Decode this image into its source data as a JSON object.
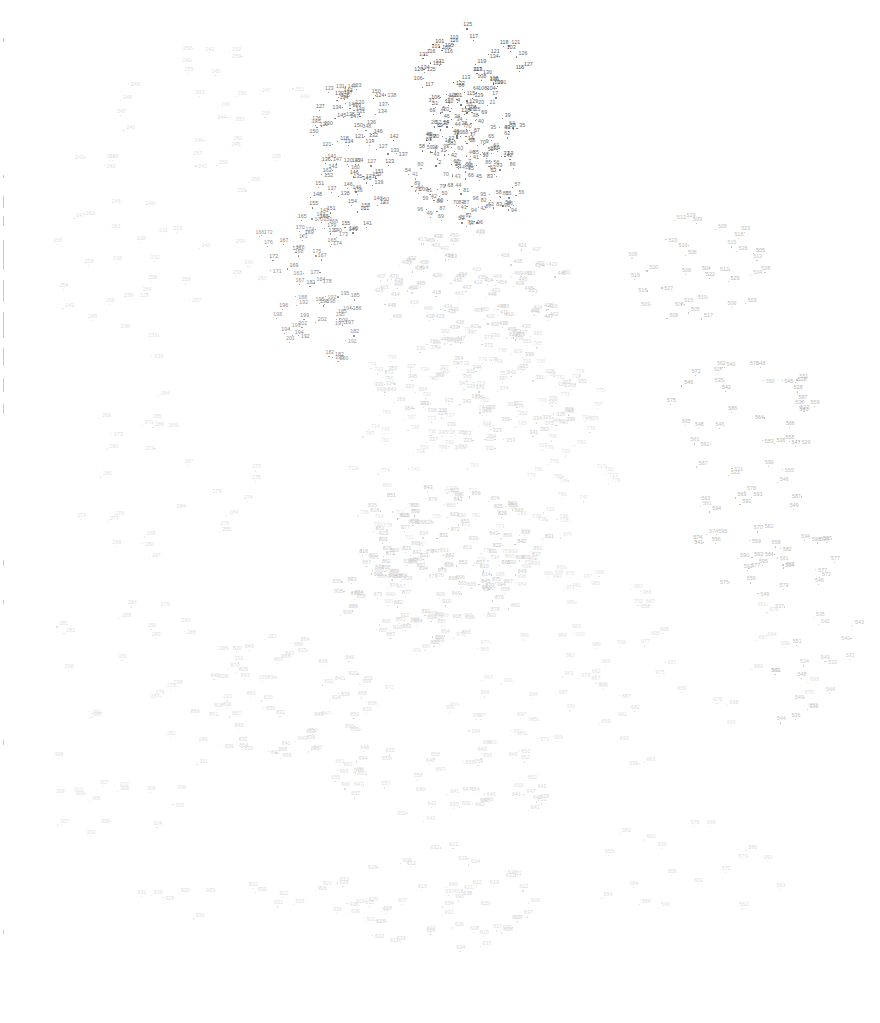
{
  "page": {
    "kind": "connect-the-dots-puzzle",
    "width": 880,
    "height": 1023,
    "background_color": "#ffffff",
    "title": ""
  },
  "render": {
    "dot_count": 1000,
    "number_start": 1,
    "number_end": 1000,
    "font_size_px": 5.2,
    "dot_radius_px": 0.65,
    "ink_dark_color": "#3a3a3a",
    "ink_mid_color": "#9a9a9a",
    "ink_light_color": "#d8d8d8",
    "ink_faintest_color": "#ececec",
    "seed": 20240517
  },
  "clusters": [
    {
      "name": "head-top-dense",
      "cx": 470,
      "cy": 70,
      "rx": 55,
      "ry": 42,
      "count": 48,
      "ink": 0.12,
      "num_lo": 100,
      "num_hi": 135
    },
    {
      "name": "core-upper-dense",
      "cx": 468,
      "cy": 135,
      "rx": 52,
      "ry": 46,
      "count": 80,
      "ink": 0.16,
      "num_lo": 1,
      "num_hi": 70
    },
    {
      "name": "core-center-dense",
      "cx": 462,
      "cy": 185,
      "rx": 58,
      "ry": 44,
      "count": 70,
      "ink": 0.22,
      "num_lo": 40,
      "num_hi": 100
    },
    {
      "name": "left-ridge-dark",
      "cx": 355,
      "cy": 130,
      "rx": 46,
      "ry": 50,
      "count": 52,
      "ink": 0.18,
      "num_lo": 118,
      "num_hi": 152
    },
    {
      "name": "left-ridge-lower",
      "cx": 345,
      "cy": 195,
      "rx": 40,
      "ry": 38,
      "count": 34,
      "ink": 0.2,
      "num_lo": 136,
      "num_hi": 162
    },
    {
      "name": "left-mid-band",
      "cx": 300,
      "cy": 250,
      "rx": 44,
      "ry": 36,
      "count": 30,
      "ink": 0.28,
      "num_lo": 163,
      "num_hi": 180
    },
    {
      "name": "left-mid-lower",
      "cx": 320,
      "cy": 325,
      "rx": 46,
      "ry": 40,
      "count": 32,
      "ink": 0.3,
      "num_lo": 180,
      "num_hi": 202
    },
    {
      "name": "mid-body-broad",
      "cx": 470,
      "cy": 290,
      "rx": 95,
      "ry": 60,
      "count": 95,
      "ink": 0.62,
      "num_lo": 400,
      "num_hi": 470
    },
    {
      "name": "mid-body-center",
      "cx": 480,
      "cy": 390,
      "rx": 100,
      "ry": 62,
      "count": 90,
      "ink": 0.66,
      "num_lo": 320,
      "num_hi": 400
    },
    {
      "name": "right-upper-chain",
      "cx": 700,
      "cy": 270,
      "rx": 70,
      "ry": 55,
      "count": 34,
      "ink": 0.52,
      "num_lo": 502,
      "num_hi": 530
    },
    {
      "name": "right-mid-chain",
      "cx": 740,
      "cy": 420,
      "rx": 78,
      "ry": 60,
      "count": 38,
      "ink": 0.5,
      "num_lo": 520,
      "num_hi": 590
    },
    {
      "name": "right-lower-chain",
      "cx": 760,
      "cy": 540,
      "rx": 80,
      "ry": 62,
      "count": 40,
      "ink": 0.52,
      "num_lo": 540,
      "num_hi": 600
    },
    {
      "name": "right-edge-sparse",
      "cx": 815,
      "cy": 660,
      "rx": 45,
      "ry": 110,
      "count": 20,
      "ink": 0.58,
      "num_lo": 530,
      "num_hi": 552
    },
    {
      "name": "center-lower-dense",
      "cx": 450,
      "cy": 540,
      "rx": 95,
      "ry": 55,
      "count": 85,
      "ink": 0.6,
      "num_lo": 800,
      "num_hi": 880
    },
    {
      "name": "center-lower-b",
      "cx": 420,
      "cy": 600,
      "rx": 90,
      "ry": 50,
      "count": 60,
      "ink": 0.64,
      "num_lo": 850,
      "num_hi": 912
    },
    {
      "name": "lower-left-band",
      "cx": 280,
      "cy": 700,
      "rx": 90,
      "ry": 60,
      "count": 55,
      "ink": 0.7,
      "num_lo": 820,
      "num_hi": 870
    },
    {
      "name": "lower-center-band",
      "cx": 450,
      "cy": 780,
      "rx": 120,
      "ry": 45,
      "count": 50,
      "ink": 0.72,
      "num_lo": 640,
      "num_hi": 660
    },
    {
      "name": "bottom-cluster",
      "cx": 430,
      "cy": 900,
      "rx": 100,
      "ry": 55,
      "count": 45,
      "ink": 0.7,
      "num_lo": 606,
      "num_hi": 640
    },
    {
      "name": "bottom-row-far",
      "cx": 300,
      "cy": 905,
      "rx": 180,
      "ry": 22,
      "count": 22,
      "ink": 0.74,
      "num_lo": 920,
      "num_hi": 940
    },
    {
      "name": "top-left-sparse",
      "cx": 190,
      "cy": 110,
      "rx": 130,
      "ry": 90,
      "count": 34,
      "ink": 0.8,
      "num_lo": 240,
      "num_hi": 262
    },
    {
      "name": "left-sparse-mid",
      "cx": 160,
      "cy": 270,
      "rx": 110,
      "ry": 90,
      "count": 30,
      "ink": 0.78,
      "num_lo": 226,
      "num_hi": 264
    },
    {
      "name": "left-sparse-low",
      "cx": 150,
      "cy": 470,
      "rx": 110,
      "ry": 90,
      "count": 26,
      "ink": 0.78,
      "num_lo": 264,
      "num_hi": 290
    },
    {
      "name": "left-sparse-lower",
      "cx": 160,
      "cy": 660,
      "rx": 110,
      "ry": 90,
      "count": 24,
      "ink": 0.8,
      "num_lo": 275,
      "num_hi": 300
    },
    {
      "name": "left-bottom-sparse",
      "cx": 120,
      "cy": 790,
      "rx": 95,
      "ry": 60,
      "count": 16,
      "ink": 0.82,
      "num_lo": 300,
      "num_hi": 312
    },
    {
      "name": "right-far-sparse",
      "cx": 700,
      "cy": 680,
      "rx": 110,
      "ry": 100,
      "count": 26,
      "ink": 0.74,
      "num_lo": 655,
      "num_hi": 700
    },
    {
      "name": "right-bottom-sparse",
      "cx": 690,
      "cy": 880,
      "rx": 110,
      "ry": 70,
      "count": 18,
      "ink": 0.76,
      "num_lo": 552,
      "num_hi": 604
    },
    {
      "name": "center-fill-haze",
      "cx": 480,
      "cy": 450,
      "rx": 150,
      "ry": 120,
      "count": 110,
      "ink": 0.8,
      "num_lo": 700,
      "num_hi": 800
    },
    {
      "name": "center-fill-haze-b",
      "cx": 520,
      "cy": 640,
      "rx": 150,
      "ry": 110,
      "count": 70,
      "ink": 0.84,
      "num_lo": 960,
      "num_hi": 1000
    }
  ],
  "scan_edge_ticks": [
    {
      "top": 38,
      "height": 4
    },
    {
      "top": 175,
      "height": 3
    },
    {
      "top": 196,
      "height": 12
    },
    {
      "top": 216,
      "height": 10
    },
    {
      "top": 240,
      "height": 30
    },
    {
      "top": 280,
      "height": 22
    },
    {
      "top": 312,
      "height": 26
    },
    {
      "top": 348,
      "height": 18
    },
    {
      "top": 378,
      "height": 14
    },
    {
      "top": 404,
      "height": 10
    },
    {
      "top": 560,
      "height": 6
    },
    {
      "top": 600,
      "height": 4
    },
    {
      "top": 740,
      "height": 5
    },
    {
      "top": 930,
      "height": 4
    }
  ],
  "corner_mark": {
    "label": "",
    "x": 8,
    "y": 12
  }
}
